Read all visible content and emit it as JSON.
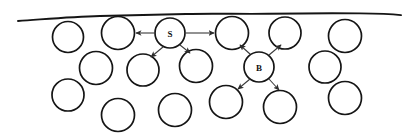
{
  "figure": {
    "background_color": "#ffffff",
    "stroke_color": "#151515",
    "arrow_color": "#3a3a3a",
    "width": 412,
    "height": 140,
    "surface": {
      "name": "free-surface-wavy-line",
      "path": "M 18,21 C 45,19.2 70,16.8 100,16.0 C 132,15.1 160,14.6 186,14.0 C 214,13.3 240,14.2 268,13.8 C 300,13.3 330,13.0 360,13.4 C 378,13.6 392,14.2 401,15.1"
    },
    "bubbles": [
      {
        "id": "b1",
        "cx": 68,
        "cy": 37,
        "r": 15.5,
        "label": ""
      },
      {
        "id": "b2",
        "cx": 118,
        "cy": 33,
        "r": 16.5,
        "label": ""
      },
      {
        "id": "S",
        "cx": 170,
        "cy": 33,
        "r": 15.0,
        "label": "S"
      },
      {
        "id": "b4",
        "cx": 232,
        "cy": 33,
        "r": 16.5,
        "label": ""
      },
      {
        "id": "b5",
        "cx": 285,
        "cy": 33,
        "r": 16.0,
        "label": ""
      },
      {
        "id": "b6",
        "cx": 345,
        "cy": 36,
        "r": 16.5,
        "label": ""
      },
      {
        "id": "b7",
        "cx": 96,
        "cy": 68,
        "r": 16.5,
        "label": ""
      },
      {
        "id": "b8",
        "cx": 143,
        "cy": 70,
        "r": 16.0,
        "label": ""
      },
      {
        "id": "b9",
        "cx": 196,
        "cy": 66,
        "r": 16.5,
        "label": ""
      },
      {
        "id": "B",
        "cx": 259,
        "cy": 67,
        "r": 15.0,
        "label": "B"
      },
      {
        "id": "b11",
        "cx": 325,
        "cy": 67,
        "r": 16.0,
        "label": ""
      },
      {
        "id": "b12",
        "cx": 68,
        "cy": 95,
        "r": 16.0,
        "label": ""
      },
      {
        "id": "b13",
        "cx": 118,
        "cy": 115,
        "r": 16.5,
        "label": ""
      },
      {
        "id": "b14",
        "cx": 175,
        "cy": 110,
        "r": 16.5,
        "label": ""
      },
      {
        "id": "b15",
        "cx": 226,
        "cy": 102,
        "r": 16.5,
        "label": ""
      },
      {
        "id": "b16",
        "cx": 280,
        "cy": 107,
        "r": 16.5,
        "label": ""
      },
      {
        "id": "b17",
        "cx": 345,
        "cy": 98,
        "r": 16.5,
        "label": ""
      }
    ],
    "arrows": [
      {
        "id": "a1",
        "from": "S",
        "to": "b2",
        "x1": 154,
        "y1": 33,
        "x2": 136,
        "y2": 33
      },
      {
        "id": "a2",
        "from": "S",
        "to": "b4",
        "x1": 186,
        "y1": 33,
        "x2": 214,
        "y2": 33
      },
      {
        "id": "a3",
        "from": "S",
        "to": "b8",
        "x1": 163,
        "y1": 47,
        "x2": 151,
        "y2": 57
      },
      {
        "id": "a4",
        "from": "S",
        "to": "b9",
        "x1": 180,
        "y1": 45,
        "x2": 190,
        "y2": 53
      },
      {
        "id": "a5",
        "from": "B",
        "to": "b4",
        "x1": 250,
        "y1": 54,
        "x2": 240,
        "y2": 45
      },
      {
        "id": "a6",
        "from": "B",
        "to": "b5",
        "x1": 269,
        "y1": 55,
        "x2": 281,
        "y2": 45
      },
      {
        "id": "a7",
        "from": "B",
        "to": "b15",
        "x1": 250,
        "y1": 79,
        "x2": 238,
        "y2": 89
      },
      {
        "id": "a8",
        "from": "B",
        "to": "b16",
        "x1": 269,
        "y1": 79,
        "x2": 279,
        "y2": 90
      }
    ]
  }
}
